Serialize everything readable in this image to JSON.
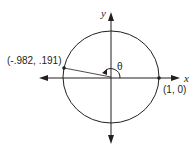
{
  "diagram": {
    "type": "unit-circle",
    "axes": {
      "x_label": "x",
      "y_label": "y"
    },
    "angle_label": "θ",
    "points": [
      {
        "name": "terminal-point",
        "label": "(-.982, .191)",
        "x": -0.982,
        "y": 0.191
      },
      {
        "name": "initial-point",
        "label": "(1, 0)",
        "x": 1,
        "y": 0
      }
    ],
    "colors": {
      "stroke": "#231f20",
      "background": "#ffffff"
    }
  }
}
